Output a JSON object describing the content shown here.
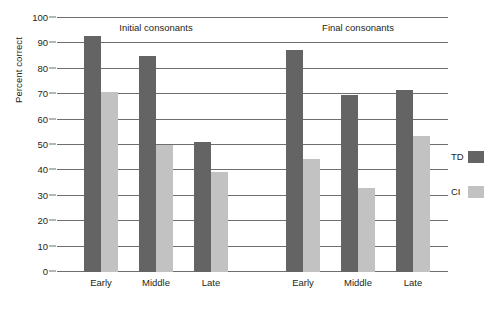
{
  "chart_data": {
    "type": "bar",
    "title": "",
    "xlabel": "",
    "ylabel": "Percent correct",
    "ylim": [
      0,
      100
    ],
    "ytick_step": 10,
    "yticks": [
      0,
      10,
      20,
      30,
      40,
      50,
      60,
      70,
      80,
      90,
      100
    ],
    "grid": true,
    "legend_position": "right",
    "panels": [
      {
        "title": "Initial consonants",
        "categories": [
          "Early",
          "Middle",
          "Late"
        ],
        "series": [
          {
            "name": "TD",
            "values": [
              93,
              85,
              51
            ]
          },
          {
            "name": "CI",
            "values": [
              71,
              50,
              39.5
            ]
          }
        ]
      },
      {
        "title": "Final consonants",
        "categories": [
          "Early",
          "Middle",
          "Late"
        ],
        "series": [
          {
            "name": "TD",
            "values": [
              87.5,
              69.5,
              71.5
            ]
          },
          {
            "name": "CI",
            "values": [
              44.5,
              33,
              53.5
            ]
          }
        ]
      }
    ],
    "legend": [
      {
        "label": "TD",
        "color": "#646464"
      },
      {
        "label": "CI",
        "color": "#c2c2c2"
      }
    ],
    "colors": {
      "td": "#646464",
      "ci": "#c2c2c2",
      "axis": "#6d6e71",
      "text": "#231f20"
    }
  }
}
